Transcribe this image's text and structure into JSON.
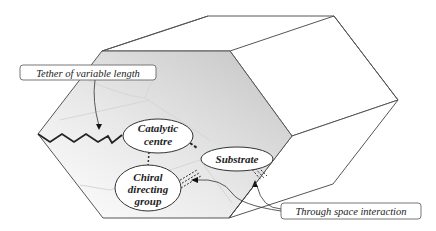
{
  "diagram": {
    "nodes": {
      "catalytic_centre": {
        "line1": "Catalytic",
        "line2": "centre"
      },
      "substrate": {
        "label": "Substrate"
      },
      "chiral_group": {
        "line1": "Chiral",
        "line2": "directing",
        "line3": "group"
      }
    },
    "callouts": {
      "tether": "Tether of variable length",
      "through_space": "Through space interaction"
    },
    "colors": {
      "edge": "#555555",
      "shade_dark": "#c8c8c8",
      "shade_light": "#ffffff",
      "text": "#222222"
    }
  }
}
